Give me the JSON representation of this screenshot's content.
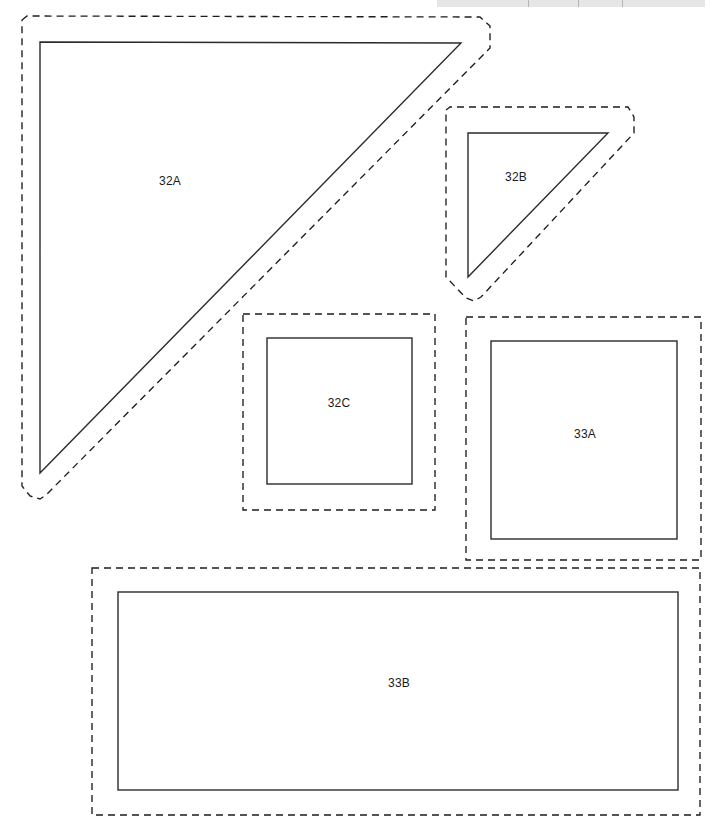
{
  "canvas": {
    "width": 721,
    "height": 830,
    "background": "#ffffff",
    "part_stroke": "#2b2b2b",
    "offset_stroke": "#1d1d1d",
    "label_color": "#1a1a1a",
    "strip_color": "#e2e2e2"
  },
  "top_strip": {
    "name": "cropped-toolbar-remnant",
    "x": 437,
    "y": 0,
    "width": 268,
    "height": 7,
    "ticks": [
      528,
      578,
      622
    ]
  },
  "parts": [
    {
      "id": "32A",
      "label": "32A",
      "shape": "right-triangle",
      "label_x": 170,
      "label_y": 182,
      "outline_points": "40,42 461,43 40,473",
      "offset_points": "22,20 27,16 480,17 490,26 490,48 46,495 40,499 30,496 22,486",
      "bbox": {
        "x": 40,
        "y": 42,
        "width": 421,
        "height": 431
      }
    },
    {
      "id": "32B",
      "label": "32B",
      "shape": "right-triangle",
      "label_x": 516,
      "label_y": 178,
      "outline_points": "468,133 608,133 468,277",
      "offset_points": "446,110 450,107 628,107 634,117 634,133 481,297 474,301 466,298 446,277",
      "bbox": {
        "x": 468,
        "y": 133,
        "width": 140,
        "height": 144
      }
    },
    {
      "id": "32C",
      "label": "32C",
      "shape": "square",
      "label_x": 339,
      "label_y": 404,
      "rect": {
        "x": 267,
        "y": 338,
        "width": 145,
        "height": 146
      },
      "offset_rect": {
        "x": 243,
        "y": 314,
        "width": 192,
        "height": 196
      }
    },
    {
      "id": "33A",
      "label": "33A",
      "shape": "square",
      "label_x": 585,
      "label_y": 435,
      "rect": {
        "x": 491,
        "y": 341,
        "width": 186,
        "height": 198
      },
      "offset_rect": {
        "x": 466,
        "y": 317,
        "width": 235,
        "height": 243
      }
    },
    {
      "id": "33B",
      "label": "33B",
      "shape": "rectangle",
      "label_x": 399,
      "label_y": 684,
      "rect": {
        "x": 118,
        "y": 592,
        "width": 560,
        "height": 198
      },
      "offset_rect": {
        "x": 92,
        "y": 568,
        "width": 608,
        "height": 247
      }
    }
  ]
}
